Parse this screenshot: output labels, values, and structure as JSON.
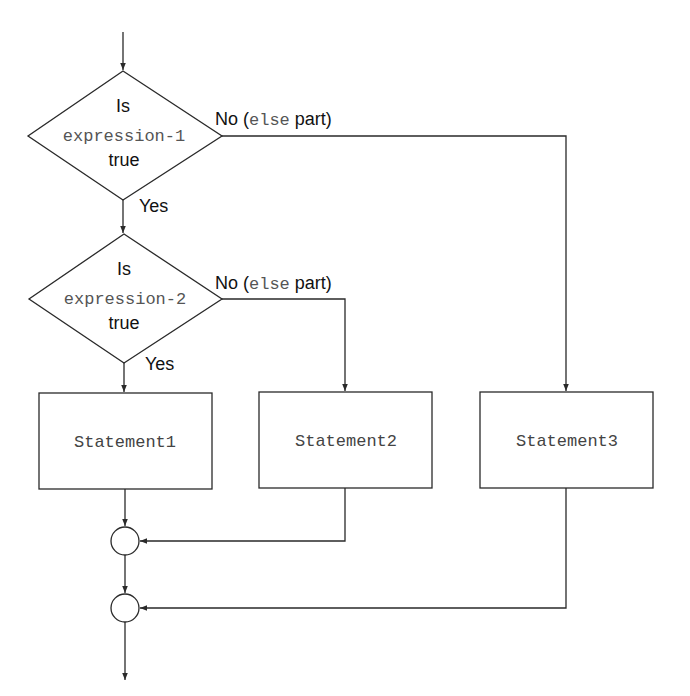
{
  "diagram": {
    "type": "flowchart",
    "title": "",
    "decision1": {
      "line1": "Is",
      "line2": "expression-1",
      "line3": "true",
      "yes_label": "Yes",
      "no_label_prefix": "No (",
      "no_label_code": "else",
      "no_label_suffix": " part)"
    },
    "decision2": {
      "line1": "Is",
      "line2": "expression-2",
      "line3": "true",
      "yes_label": "Yes",
      "no_label_prefix": "No (",
      "no_label_code": "else",
      "no_label_suffix": " part)"
    },
    "statements": [
      {
        "label": "Statement1"
      },
      {
        "label": "Statement2"
      },
      {
        "label": "Statement3"
      }
    ],
    "connectors": [
      {
        "name": "join-1"
      },
      {
        "name": "join-2"
      }
    ],
    "colors": {
      "line": "#2a2a2a",
      "text": "#111111",
      "code_text": "#555555",
      "background": "#ffffff"
    }
  }
}
